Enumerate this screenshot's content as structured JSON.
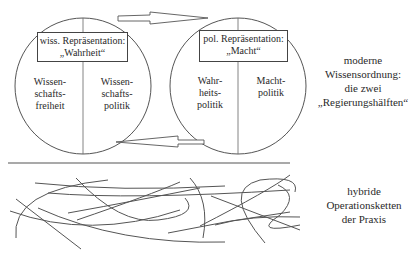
{
  "left_circle": {
    "box_line1": "wiss. Repräsentation:",
    "box_line2": "„Wahrheit“",
    "left_half": [
      "Wissen-",
      "schafts-",
      "freiheit"
    ],
    "right_half": [
      "Wissen-",
      "schafts-",
      "politik"
    ]
  },
  "right_circle": {
    "box_line1": "pol. Repräsentation:",
    "box_line2": "„Macht“",
    "left_half": [
      "Wahr-",
      "heits-",
      "politik"
    ],
    "right_half": [
      "Macht-",
      "politik"
    ]
  },
  "upper_label": [
    "moderne",
    "Wissensordnung:",
    "die zwei",
    "„Regierungshälften“"
  ],
  "lower_label": [
    "hybride",
    "Operationsketten",
    "der Praxis"
  ],
  "colors": {
    "line": "#555555",
    "text": "#2a2a2a",
    "background": "#ffffff"
  }
}
